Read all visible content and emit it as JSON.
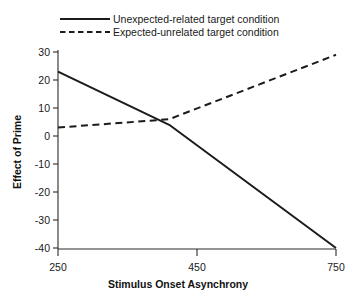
{
  "chart_data": {
    "type": "line",
    "title": "",
    "subtitle": "",
    "xlabel": "Stimulus Onset Asynchrony",
    "ylabel": "Effect of Prime",
    "x": [
      250,
      450,
      750
    ],
    "xlim": [
      250,
      750
    ],
    "ylim": [
      -40,
      30
    ],
    "xticks": [
      250,
      450,
      750
    ],
    "yticks": [
      30,
      20,
      10,
      0,
      -10,
      -20,
      -30,
      -40
    ],
    "xtick_labels": [
      "250",
      "450",
      "750"
    ],
    "ytick_labels": [
      "30",
      "20",
      "10",
      "0",
      "-10",
      "-20",
      "-30",
      "-40"
    ],
    "grid": false,
    "legend_position": "top",
    "series": [
      {
        "name": "Unexpected-related target condition",
        "style": "solid",
        "color": "#1b1b1b",
        "values": [
          23,
          4,
          -40
        ]
      },
      {
        "name": "Expected-unrelated target condition",
        "style": "dashed",
        "color": "#1b1b1b",
        "values": [
          3,
          6,
          29
        ]
      }
    ]
  },
  "legend": {
    "items": [
      {
        "label": "Unexpected-related target condition",
        "style": "solid"
      },
      {
        "label": "Expected-unrelated target condition",
        "style": "dashed"
      }
    ]
  },
  "axes": {
    "x_title": "Stimulus Onset Asynchrony",
    "y_title": "Effect of Prime",
    "x_ticks": [
      "250",
      "450",
      "750"
    ],
    "y_ticks": [
      "30",
      "20",
      "10",
      "0",
      "-10",
      "-20",
      "-30",
      "-40"
    ]
  },
  "colors": {
    "background": "#ffffff",
    "axis": "#2b2b2b",
    "line": "#1b1b1b",
    "text": "#1a1a1a"
  }
}
